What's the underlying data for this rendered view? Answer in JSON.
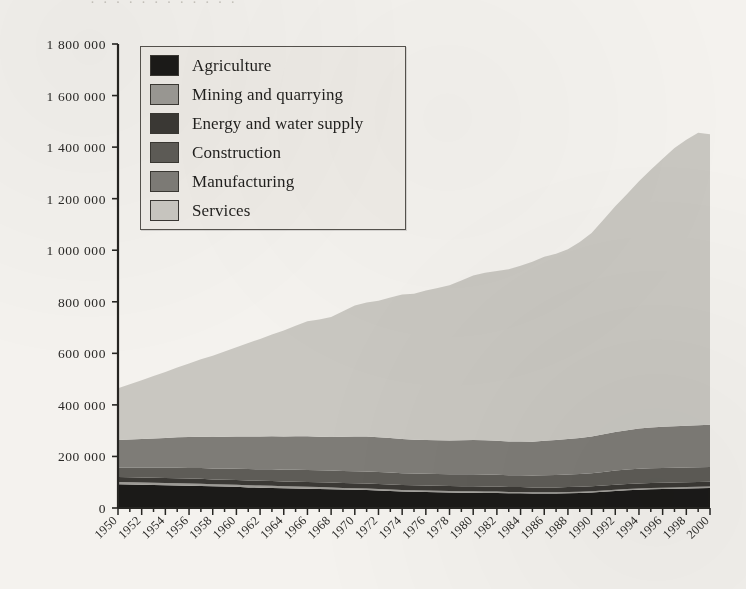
{
  "page": {
    "top_bleed_text": "· · · · · · · · · · · ·",
    "background_color": "#f4f2ee"
  },
  "legend": {
    "position": "inside-top-left",
    "items": [
      {
        "label": "Agriculture",
        "color": "#1b1a18"
      },
      {
        "label": "Mining and quarrying",
        "color": "#9c9a95"
      },
      {
        "label": "Energy and water supply",
        "color": "#3b3935"
      },
      {
        "label": "Construction",
        "color": "#5e5c57"
      },
      {
        "label": "Manufacturing",
        "color": "#7e7c77"
      },
      {
        "label": "Services",
        "color": "#c9c7c1"
      }
    ]
  },
  "axes": {
    "y_ticks": [
      "0",
      "200 000",
      "400 000",
      "600 000",
      "800 000",
      "1 000 000",
      "1 200 000",
      "1 400 000",
      "1 600 000",
      "1 800 000"
    ],
    "x_ticks": [
      "1950",
      "1952",
      "1954",
      "1956",
      "1958",
      "1960",
      "1962",
      "1964",
      "1966",
      "1968",
      "1970",
      "1972",
      "1974",
      "1976",
      "1978",
      "1980",
      "1982",
      "1984",
      "1986",
      "1988",
      "1990",
      "1992",
      "1994",
      "1996",
      "1998",
      "2000"
    ],
    "axis_color": "#262522",
    "x_rotation_deg": -45
  },
  "chart_data": {
    "type": "area",
    "title": "",
    "xlabel": "",
    "ylabel": "",
    "stacked": true,
    "grid": false,
    "legend_position": "inside-top-left",
    "ylim": [
      0,
      1800000
    ],
    "xlim": [
      1950,
      2000
    ],
    "ytick_values": [
      0,
      200000,
      400000,
      600000,
      800000,
      1000000,
      1200000,
      1400000,
      1600000,
      1800000
    ],
    "x": [
      1950,
      1951,
      1952,
      1953,
      1954,
      1955,
      1956,
      1957,
      1958,
      1959,
      1960,
      1961,
      1962,
      1963,
      1964,
      1965,
      1966,
      1967,
      1968,
      1969,
      1970,
      1971,
      1972,
      1973,
      1974,
      1975,
      1976,
      1977,
      1978,
      1979,
      1980,
      1981,
      1982,
      1983,
      1984,
      1985,
      1986,
      1987,
      1988,
      1989,
      1990,
      1991,
      1992,
      1993,
      1994,
      1995,
      1996,
      1997,
      1998,
      1999,
      2000
    ],
    "series": [
      {
        "name": "Agriculture",
        "color": "#1b1a18",
        "values": [
          92000,
          91000,
          90000,
          89000,
          88000,
          87000,
          86000,
          85000,
          84000,
          83000,
          82000,
          80000,
          79000,
          78000,
          77000,
          76000,
          75000,
          74000,
          73000,
          72000,
          71000,
          70000,
          68000,
          66000,
          64000,
          63000,
          62000,
          61000,
          60000,
          59000,
          59000,
          58000,
          58000,
          57000,
          57000,
          56000,
          56000,
          56000,
          57000,
          58000,
          60000,
          63000,
          66000,
          69000,
          71000,
          73000,
          74000,
          75000,
          76000,
          77000,
          78000
        ]
      },
      {
        "name": "Mining and quarrying",
        "color": "#9c9a95",
        "values": [
          9000,
          9000,
          9000,
          9000,
          9000,
          9000,
          9000,
          9000,
          8000,
          8000,
          8000,
          8000,
          8000,
          8000,
          7000,
          7000,
          7000,
          7000,
          7000,
          6000,
          6000,
          6000,
          6000,
          6000,
          6000,
          6000,
          6000,
          6000,
          6000,
          6000,
          6000,
          6000,
          6000,
          5000,
          5000,
          5000,
          5000,
          5000,
          5000,
          5000,
          5000,
          5000,
          5000,
          5000,
          5000,
          5000,
          5000,
          5000,
          5000,
          5000,
          5000
        ]
      },
      {
        "name": "Energy and water supply",
        "color": "#3b3935",
        "values": [
          19000,
          19000,
          19000,
          19000,
          19000,
          19000,
          19000,
          19000,
          19000,
          19000,
          19000,
          19000,
          19000,
          19000,
          19000,
          19000,
          19000,
          19000,
          19000,
          19000,
          19000,
          19000,
          19000,
          19000,
          19000,
          19000,
          19000,
          19000,
          19000,
          19000,
          19000,
          19000,
          19000,
          19000,
          19000,
          19000,
          19000,
          19000,
          19000,
          19000,
          19000,
          19000,
          19000,
          19000,
          19000,
          19000,
          19000,
          19000,
          19000,
          19000,
          19000
        ]
      },
      {
        "name": "Construction",
        "color": "#5e5c57",
        "values": [
          36000,
          37000,
          38000,
          39000,
          40000,
          41000,
          41000,
          42000,
          42000,
          43000,
          43000,
          44000,
          44000,
          45000,
          45000,
          46000,
          46000,
          46000,
          46000,
          47000,
          47000,
          47000,
          47000,
          47000,
          46000,
          46000,
          46000,
          46000,
          46000,
          47000,
          47000,
          47000,
          46000,
          46000,
          46000,
          46000,
          47000,
          48000,
          49000,
          50000,
          51000,
          53000,
          55000,
          56000,
          57000,
          57000,
          57000,
          57000,
          57000,
          57000,
          57000
        ]
      },
      {
        "name": "Manufacturing",
        "color": "#7e7c77",
        "values": [
          108000,
          110000,
          112000,
          114000,
          116000,
          118000,
          120000,
          121000,
          122000,
          123000,
          125000,
          126000,
          127000,
          128000,
          129000,
          130000,
          131000,
          130000,
          130000,
          132000,
          134000,
          135000,
          134000,
          134000,
          133000,
          131000,
          131000,
          131000,
          131000,
          132000,
          133000,
          133000,
          132000,
          131000,
          131000,
          131000,
          134000,
          136000,
          138000,
          140000,
          142000,
          146000,
          150000,
          153000,
          156000,
          158000,
          160000,
          161000,
          162000,
          163000,
          164000
        ]
      },
      {
        "name": "Services",
        "color": "#c9c7c1",
        "values": [
          201000,
          214000,
          228000,
          242000,
          256000,
          271000,
          286000,
          301000,
          316000,
          331000,
          347000,
          363000,
          379000,
          395000,
          412000,
          429000,
          446000,
          455000,
          466000,
          487000,
          509000,
          520000,
          530000,
          545000,
          560000,
          566000,
          580000,
          590000,
          602000,
          620000,
          638000,
          650000,
          658000,
          668000,
          682000,
          698000,
          714000,
          722000,
          736000,
          760000,
          790000,
          832000,
          876000,
          916000,
          960000,
          1000000,
          1040000,
          1080000,
          1110000,
          1135000,
          1127000
        ]
      }
    ]
  }
}
